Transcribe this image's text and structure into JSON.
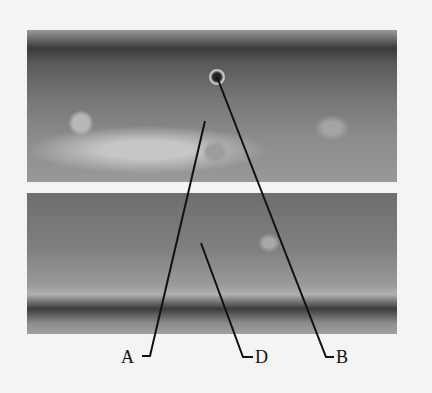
{
  "figure": {
    "panels": [
      {
        "id": "top",
        "position": "upper photo"
      },
      {
        "id": "bottom",
        "position": "lower photo"
      }
    ],
    "labels": [
      {
        "id": "A",
        "text": "A"
      },
      {
        "id": "D",
        "text": "D"
      },
      {
        "id": "B",
        "text": "B"
      }
    ]
  }
}
